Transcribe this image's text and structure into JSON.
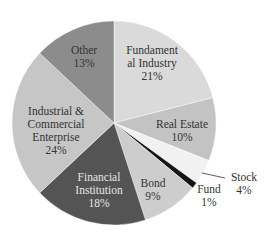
{
  "chart_data": {
    "type": "pie",
    "title": "",
    "start_angle_deg": 0,
    "direction": "clockwise",
    "center": [
      114,
      123
    ],
    "radius": 102,
    "slices": [
      {
        "label": "Fundament\nal Industry",
        "name": "Fundamental Industry",
        "value": 21,
        "pct_label": "21%",
        "color": "#dadada",
        "label_pos": [
          152,
          63
        ],
        "text_color": "dark"
      },
      {
        "label": "Real Estate",
        "name": "Real Estate",
        "value": 10,
        "pct_label": "10%",
        "color": "#c3c3c3",
        "label_pos": [
          182,
          131
        ],
        "text_color": "dark"
      },
      {
        "label": "Stock",
        "name": "Stock",
        "value": 4,
        "pct_label": "4%",
        "color": "#f1f1f1",
        "label_pos": [
          244,
          184
        ],
        "text_color": "dark",
        "external": true,
        "leader": [
          [
            202,
            173
          ],
          [
            225,
            178
          ]
        ]
      },
      {
        "label": "Fund",
        "name": "Fund",
        "value": 1,
        "pct_label": "1%",
        "color": "#151515",
        "label_pos": [
          209,
          196
        ],
        "text_color": "dark",
        "external": true
      },
      {
        "label": "Bond",
        "name": "Bond",
        "value": 9,
        "pct_label": "9%",
        "color": "#cdcdcd",
        "label_pos": [
          153,
          190
        ],
        "text_color": "dark"
      },
      {
        "label": "Financial\nInstitution",
        "name": "Financial Institution",
        "value": 18,
        "pct_label": "18%",
        "color": "#545454",
        "label_pos": [
          99,
          190
        ],
        "text_color": "light"
      },
      {
        "label": "Industrial &\nCommercial\nEnterprise",
        "name": "Industrial & Commercial Enterprise",
        "value": 24,
        "pct_label": "24%",
        "color": "#c6c6c6",
        "label_pos": [
          56,
          131
        ],
        "text_color": "dark"
      },
      {
        "label": "Other",
        "name": "Other",
        "value": 13,
        "pct_label": "13%",
        "color": "#8c8c8c",
        "label_pos": [
          84,
          57
        ],
        "text_color": "dark"
      }
    ],
    "categories": [
      "Fundamental Industry",
      "Real Estate",
      "Stock",
      "Fund",
      "Bond",
      "Financial Institution",
      "Industrial & Commercial Enterprise",
      "Other"
    ],
    "values": [
      21,
      10,
      4,
      1,
      9,
      18,
      24,
      13
    ],
    "legend": "none (labels on slices)"
  }
}
